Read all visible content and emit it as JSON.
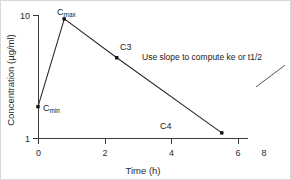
{
  "chart_data": {
    "type": "line",
    "title": "",
    "xlabel": "Time (h)",
    "ylabel": "Concentration (µg/ml)",
    "yscale": "log",
    "xscale": "linear",
    "xlim": [
      0,
      8
    ],
    "ylim": [
      1,
      10
    ],
    "grid": false,
    "legend": "none",
    "x_ticks": [
      "0",
      "2",
      "4",
      "6",
      "8"
    ],
    "x_tick_values": [
      0,
      2,
      4,
      6,
      8
    ],
    "y_ticks": [
      "1",
      "10"
    ],
    "y_tick_values": [
      1,
      10
    ],
    "series": [
      {
        "name": "plasma concentration",
        "x": [
          0,
          1,
          3,
          7
        ],
        "values": [
          1.8,
          9.3,
          4.5,
          1.1
        ],
        "point_labels": [
          "Cmin",
          "Cmax",
          "C3",
          "C4"
        ]
      }
    ],
    "points": [
      {
        "label_main": "C",
        "label_sub": "min",
        "x": 0,
        "y": 1.8
      },
      {
        "label_main": "C",
        "label_sub": "max",
        "x": 1,
        "y": 9.3
      },
      {
        "label_main": "C3",
        "label_sub": "",
        "x": 3,
        "y": 4.5
      },
      {
        "label_main": "C4",
        "label_sub": "",
        "x": 7,
        "y": 1.1
      }
    ],
    "annotations": [
      {
        "text": "Use slope to compute ke or t1/2",
        "x": 8.0,
        "y": 4.6,
        "leader_from": [
          9.4,
          3.9
        ],
        "leader_to": [
          8.3,
          2.6
        ]
      }
    ],
    "colors": {
      "line": "#2b2b2b",
      "marker": "#111111",
      "axis": "#3a3a3a",
      "text": "#1a1a1a",
      "background": "#ffffff"
    }
  }
}
